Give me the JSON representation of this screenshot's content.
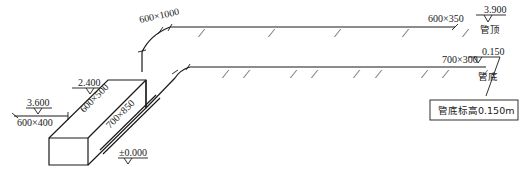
{
  "diagram": {
    "type": "hvac-duct-isometric",
    "labels": {
      "top_duct_riser": "600×1000",
      "top_duct_end": "600×350",
      "bottom_duct_end": "700×300",
      "diag_upper": "600×500",
      "diag_lower": "700×850",
      "inlet": "600×400"
    },
    "elevations": {
      "top_end": "3.900",
      "bottom_end": "0.150",
      "unit_top": "2.400",
      "inlet": "3.600",
      "ground": "±0.000"
    },
    "annotations": {
      "pipe_top": "管顶",
      "pipe_bottom": "管底",
      "note_box": "管底标高0.150m"
    },
    "top_diffusers_x": [
      200,
      270,
      336,
      404,
      470
    ],
    "bottom_diffusers_x": [
      225,
      246,
      293,
      314,
      356,
      378,
      424,
      445,
      484
    ]
  }
}
